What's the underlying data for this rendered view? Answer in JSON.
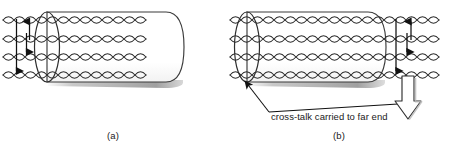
{
  "figure": {
    "panels": [
      {
        "id": "a",
        "caption": "(a)",
        "description": "near-end crosstalk into cable bundle",
        "wire_rows": 4,
        "pairs_label": "twisted pair",
        "arrow_count": 3
      },
      {
        "id": "b",
        "caption": "(b)",
        "description": "far-end crosstalk emerging from cable bundle",
        "wire_rows": 4,
        "pairs_label": "twisted pair",
        "arrow_count": 3
      }
    ],
    "annotation": {
      "text": "cross-talk carried to far end",
      "leader_target_left": "cable-near-end-ellipse",
      "leader_target_right": "far-end-block-arrow"
    },
    "colors": {
      "ink": "#1a1a1a",
      "wire": "#2b2b2b",
      "cylinder_fill": "#ffffff",
      "cylinder_stroke": "#3a3a3a",
      "shadow": "#b9b9b9",
      "background": "#ffffff"
    },
    "icons": {
      "block_arrow": "down-block-arrow-icon",
      "leader_arrow": "leader-arrow-icon",
      "signal_arrow_up": "signal-arrow-up-icon",
      "signal_arrow_down": "signal-arrow-down-icon"
    }
  }
}
